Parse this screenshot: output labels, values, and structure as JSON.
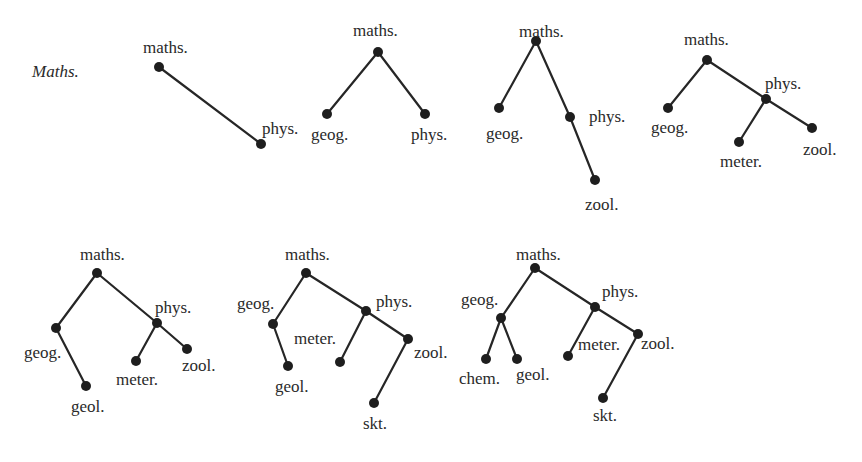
{
  "figure": {
    "title": {
      "text": "Maths.",
      "x": 32,
      "y": 77
    },
    "colors": {
      "ink": "#262626",
      "background": "#ffffff"
    },
    "trees": [
      {
        "id": "tree-1",
        "nodes": [
          {
            "id": "maths",
            "label": "maths.",
            "x": 159,
            "y": 67,
            "lx": 143,
            "ly": 53
          },
          {
            "id": "phys",
            "label": "phys.",
            "x": 261,
            "y": 144,
            "lx": 262,
            "ly": 134
          }
        ],
        "edges": [
          [
            "maths",
            "phys"
          ]
        ]
      },
      {
        "id": "tree-2",
        "nodes": [
          {
            "id": "maths",
            "label": "maths.",
            "x": 378,
            "y": 52,
            "lx": 353,
            "ly": 36
          },
          {
            "id": "geog",
            "label": "geog.",
            "x": 327,
            "y": 114,
            "lx": 311,
            "ly": 140
          },
          {
            "id": "phys",
            "label": "phys.",
            "x": 425,
            "y": 114,
            "lx": 411,
            "ly": 140
          }
        ],
        "edges": [
          [
            "maths",
            "geog"
          ],
          [
            "maths",
            "phys"
          ]
        ]
      },
      {
        "id": "tree-3",
        "nodes": [
          {
            "id": "maths",
            "label": "maths.",
            "x": 536,
            "y": 41,
            "lx": 519,
            "ly": 37
          },
          {
            "id": "geog",
            "label": "geog.",
            "x": 499,
            "y": 108,
            "lx": 486,
            "ly": 139
          },
          {
            "id": "phys",
            "label": "phys.",
            "x": 570,
            "y": 117,
            "lx": 589,
            "ly": 122
          },
          {
            "id": "zool",
            "label": "zool.",
            "x": 595,
            "y": 180,
            "lx": 585,
            "ly": 210
          }
        ],
        "edges": [
          [
            "maths",
            "geog"
          ],
          [
            "maths",
            "phys"
          ],
          [
            "phys",
            "zool"
          ]
        ]
      },
      {
        "id": "tree-4",
        "nodes": [
          {
            "id": "maths",
            "label": "maths.",
            "x": 707,
            "y": 60,
            "lx": 684,
            "ly": 45
          },
          {
            "id": "geog",
            "label": "geog.",
            "x": 668,
            "y": 108,
            "lx": 651,
            "ly": 133
          },
          {
            "id": "phys",
            "label": "phys.",
            "x": 766,
            "y": 99,
            "lx": 765,
            "ly": 89
          },
          {
            "id": "meter",
            "label": "meter.",
            "x": 739,
            "y": 142,
            "lx": 720,
            "ly": 167
          },
          {
            "id": "zool",
            "label": "zool.",
            "x": 812,
            "y": 128,
            "lx": 803,
            "ly": 155
          }
        ],
        "edges": [
          [
            "maths",
            "geog"
          ],
          [
            "maths",
            "phys"
          ],
          [
            "phys",
            "meter"
          ],
          [
            "phys",
            "zool"
          ]
        ]
      },
      {
        "id": "tree-5",
        "nodes": [
          {
            "id": "maths",
            "label": "maths.",
            "x": 97,
            "y": 273,
            "lx": 80,
            "ly": 260
          },
          {
            "id": "geog",
            "label": "geog.",
            "x": 56,
            "y": 328,
            "lx": 24,
            "ly": 358
          },
          {
            "id": "geol",
            "label": "geol.",
            "x": 86,
            "y": 386,
            "lx": 71,
            "ly": 412
          },
          {
            "id": "phys",
            "label": "phys.",
            "x": 157,
            "y": 323,
            "lx": 155,
            "ly": 313
          },
          {
            "id": "meter",
            "label": "meter.",
            "x": 136,
            "y": 361,
            "lx": 116,
            "ly": 385
          },
          {
            "id": "zool",
            "label": "zool.",
            "x": 187,
            "y": 349,
            "lx": 182,
            "ly": 371
          }
        ],
        "edges": [
          [
            "maths",
            "geog"
          ],
          [
            "geog",
            "geol"
          ],
          [
            "maths",
            "phys"
          ],
          [
            "phys",
            "meter"
          ],
          [
            "phys",
            "zool"
          ]
        ]
      },
      {
        "id": "tree-6",
        "nodes": [
          {
            "id": "maths",
            "label": "maths.",
            "x": 306,
            "y": 273,
            "lx": 285,
            "ly": 260
          },
          {
            "id": "geog",
            "label": "geog.",
            "x": 273,
            "y": 324,
            "lx": 237,
            "ly": 309
          },
          {
            "id": "geol",
            "label": "geol.",
            "x": 288,
            "y": 366,
            "lx": 275,
            "ly": 392
          },
          {
            "id": "phys",
            "label": "phys.",
            "x": 366,
            "y": 311,
            "lx": 376,
            "ly": 307
          },
          {
            "id": "meter",
            "label": "meter.",
            "x": 340,
            "y": 362,
            "lx": 294,
            "ly": 344
          },
          {
            "id": "zool",
            "label": "zool.",
            "x": 408,
            "y": 339,
            "lx": 414,
            "ly": 358
          },
          {
            "id": "skt",
            "label": "skt.",
            "x": 374,
            "y": 403,
            "lx": 363,
            "ly": 429
          }
        ],
        "edges": [
          [
            "maths",
            "geog"
          ],
          [
            "geog",
            "geol"
          ],
          [
            "maths",
            "phys"
          ],
          [
            "phys",
            "meter"
          ],
          [
            "phys",
            "zool"
          ],
          [
            "zool",
            "skt"
          ]
        ]
      },
      {
        "id": "tree-7",
        "nodes": [
          {
            "id": "maths",
            "label": "maths.",
            "x": 535,
            "y": 268,
            "lx": 516,
            "ly": 260
          },
          {
            "id": "geog",
            "label": "geog.",
            "x": 501,
            "y": 318,
            "lx": 461,
            "ly": 305
          },
          {
            "id": "chem",
            "label": "chem.",
            "x": 486,
            "y": 359,
            "lx": 459,
            "ly": 384
          },
          {
            "id": "geol",
            "label": "geol.",
            "x": 517,
            "y": 359,
            "lx": 516,
            "ly": 380
          },
          {
            "id": "phys",
            "label": "phys.",
            "x": 595,
            "y": 307,
            "lx": 602,
            "ly": 297
          },
          {
            "id": "meter",
            "label": "meter.",
            "x": 568,
            "y": 356,
            "lx": 578,
            "ly": 350
          },
          {
            "id": "zool",
            "label": "zool.",
            "x": 638,
            "y": 334,
            "lx": 641,
            "ly": 349
          },
          {
            "id": "skt",
            "label": "skt.",
            "x": 603,
            "y": 398,
            "lx": 593,
            "ly": 421
          }
        ],
        "edges": [
          [
            "maths",
            "geog"
          ],
          [
            "geog",
            "chem"
          ],
          [
            "geog",
            "geol"
          ],
          [
            "maths",
            "phys"
          ],
          [
            "phys",
            "meter"
          ],
          [
            "phys",
            "zool"
          ],
          [
            "zool",
            "skt"
          ]
        ]
      }
    ]
  }
}
